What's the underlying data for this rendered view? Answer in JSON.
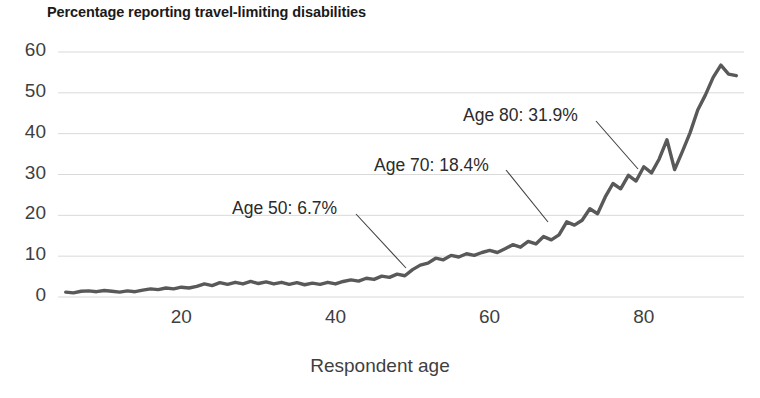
{
  "chart_data": {
    "type": "line",
    "title": "Percentage reporting travel-limiting disabilities",
    "xlabel": "Respondent age",
    "ylabel": "",
    "xlim": [
      4,
      93
    ],
    "ylim": [
      0,
      60
    ],
    "grid": true,
    "legend": "none",
    "xticks": [
      "20",
      "40",
      "60",
      "80"
    ],
    "xtick_values": [
      20,
      40,
      60,
      80
    ],
    "yticks": [
      "0",
      "10",
      "20",
      "30",
      "40",
      "50",
      "60"
    ],
    "ytick_values": [
      0,
      10,
      20,
      30,
      40,
      50,
      60
    ],
    "series": [
      {
        "name": "Percentage reporting travel-limiting disabilities",
        "color": "#595959",
        "x": [
          5,
          6,
          7,
          8,
          9,
          10,
          11,
          12,
          13,
          14,
          15,
          16,
          17,
          18,
          19,
          20,
          21,
          22,
          23,
          24,
          25,
          26,
          27,
          28,
          29,
          30,
          31,
          32,
          33,
          34,
          35,
          36,
          37,
          38,
          39,
          40,
          41,
          42,
          43,
          44,
          45,
          46,
          47,
          48,
          49,
          50,
          51,
          52,
          53,
          54,
          55,
          56,
          57,
          58,
          59,
          60,
          61,
          62,
          63,
          64,
          65,
          66,
          67,
          68,
          69,
          70,
          71,
          72,
          73,
          74,
          75,
          76,
          77,
          78,
          79,
          80,
          81,
          82,
          83,
          84,
          85,
          86,
          87,
          88,
          89,
          90,
          91,
          92
        ],
        "values": [
          1.2,
          1.0,
          1.4,
          1.5,
          1.3,
          1.6,
          1.4,
          1.2,
          1.5,
          1.3,
          1.7,
          2.0,
          1.8,
          2.2,
          2.0,
          2.4,
          2.2,
          2.6,
          3.2,
          2.8,
          3.5,
          3.1,
          3.6,
          3.2,
          3.8,
          3.3,
          3.7,
          3.2,
          3.6,
          3.1,
          3.5,
          3.0,
          3.4,
          3.1,
          3.6,
          3.2,
          3.8,
          4.2,
          3.9,
          4.6,
          4.3,
          5.1,
          4.8,
          5.6,
          5.2,
          6.7,
          7.8,
          8.3,
          9.5,
          9.1,
          10.2,
          9.8,
          10.6,
          10.2,
          10.9,
          11.4,
          10.9,
          11.8,
          12.8,
          12.2,
          13.6,
          13.0,
          14.8,
          14.0,
          15.2,
          18.4,
          17.6,
          18.8,
          21.6,
          20.4,
          24.5,
          27.8,
          26.5,
          29.8,
          28.4,
          31.9,
          30.4,
          33.8,
          38.5,
          31.2,
          35.6,
          40.2,
          45.8,
          49.5,
          53.8,
          56.8,
          54.6,
          54.2
        ]
      }
    ],
    "annotations": [
      {
        "text": "Age 50: 6.7%",
        "age": 50,
        "value": 6.7,
        "label_x": 232,
        "label_y": 198,
        "leader_x1": 356,
        "leader_y1": 214,
        "leader_x2": 406,
        "leader_y2": 268
      },
      {
        "text": "Age 70: 18.4%",
        "age": 70,
        "value": 18.4,
        "label_x": 374,
        "label_y": 155,
        "leader_x1": 506,
        "leader_y1": 170,
        "leader_x2": 548,
        "leader_y2": 222
      },
      {
        "text": "Age 80: 31.9%",
        "age": 80,
        "value": 31.9,
        "label_x": 463,
        "label_y": 105,
        "leader_x1": 596,
        "leader_y1": 121,
        "leader_x2": 638,
        "leader_y2": 169
      }
    ]
  },
  "style": {
    "line_color": "#595959",
    "grid_color": "#d9d9d9",
    "text_color": "#3f3f3f",
    "title_color": "#1a1a1a",
    "background": "#ffffff"
  }
}
